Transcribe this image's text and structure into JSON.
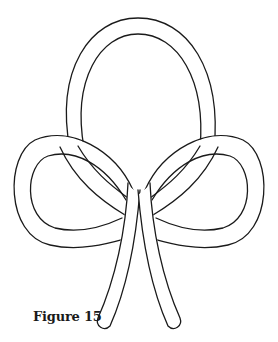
{
  "figure": {
    "caption": "Figure 15",
    "stroke_color": "#1a1a1a",
    "background": "#ffffff"
  }
}
